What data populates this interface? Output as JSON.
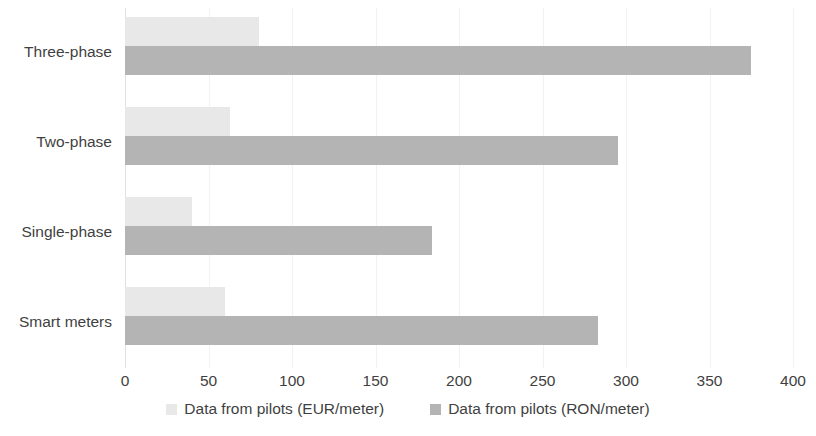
{
  "chart_data": {
    "type": "bar",
    "orientation": "horizontal",
    "title": "",
    "xlabel": "",
    "ylabel": "",
    "categories": [
      "Three-phase",
      "Two-phase",
      "Single-phase",
      "Smart meters"
    ],
    "series": [
      {
        "name": "Data from pilots (EUR/meter)",
        "color": "#e8e8e8",
        "values": [
          80,
          63,
          40,
          60
        ]
      },
      {
        "name": "Data from pilots (RON/meter)",
        "color": "#b4b4b4",
        "values": [
          375,
          295,
          184,
          283
        ]
      }
    ],
    "xlim": [
      0,
      400
    ],
    "xticks": [
      0,
      50,
      100,
      150,
      200,
      250,
      300,
      350,
      400
    ],
    "xtick_labels": [
      "0",
      "50",
      "100",
      "150",
      "200",
      "250",
      "300",
      "350",
      "400"
    ],
    "grid": true,
    "grid_axis": "x",
    "legend_position": "bottom",
    "background_color": "#ffffff",
    "text_color": "#3f3f3f"
  }
}
